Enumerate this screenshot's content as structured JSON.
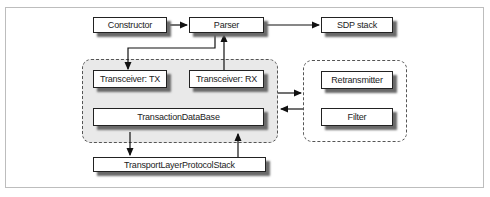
{
  "diagram": {
    "nodes": {
      "constructor": "Constructor",
      "parser": "Parser",
      "sdp_stack": "SDP stack",
      "transceiver_tx": "Transceiver: TX",
      "transceiver_rx": "Transceiver: RX",
      "transaction_db": "TransactionDataBase",
      "transport_stack": "TransportLayerProtocolStack",
      "retransmitter": "Retransmitter",
      "filter": "Filter"
    },
    "groups": [
      {
        "name": "core-cluster",
        "members": [
          "Transceiver: TX",
          "Transceiver: RX",
          "TransactionDataBase"
        ],
        "style": "dashed-shaded"
      },
      {
        "name": "reliability-cluster",
        "members": [
          "Retransmitter",
          "Filter"
        ],
        "style": "dashed"
      }
    ],
    "edges": [
      {
        "from": "Constructor",
        "to": "Parser"
      },
      {
        "from": "Parser",
        "to": "SDP stack"
      },
      {
        "from": "Parser",
        "to": "Transceiver: TX"
      },
      {
        "from": "Transceiver: RX",
        "to": "Parser"
      },
      {
        "from": "core-cluster",
        "to": "reliability-cluster"
      },
      {
        "from": "reliability-cluster",
        "to": "core-cluster"
      },
      {
        "from": "TransactionDataBase",
        "to": "TransportLayerProtocolStack"
      },
      {
        "from": "TransportLayerProtocolStack",
        "to": "TransactionDataBase"
      }
    ],
    "colors": {
      "box_border": "#222222",
      "shadow": "#6a6a6a",
      "cluster_fill": "#e9e9e9",
      "frame": "#bdbdbd"
    }
  }
}
